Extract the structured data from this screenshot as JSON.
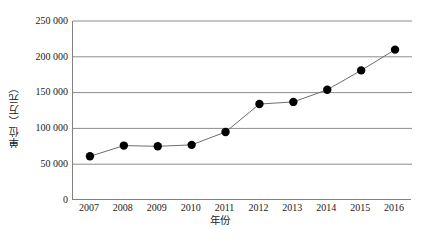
{
  "chart_data": {
    "type": "line",
    "title": "",
    "subtitle": "",
    "xlabel": "年份",
    "ylabel": "单位（万元）",
    "categories": [
      "2007",
      "2008",
      "2009",
      "2010",
      "2011",
      "2012",
      "2013",
      "2014",
      "2015",
      "2016"
    ],
    "values": [
      61000,
      76000,
      75000,
      77000,
      95000,
      134000,
      137000,
      154000,
      181000,
      210000
    ],
    "series": [
      {
        "name": "",
        "values": [
          61000,
          76000,
          75000,
          77000,
          95000,
          134000,
          137000,
          154000,
          181000,
          210000
        ]
      }
    ],
    "ylim": [
      0,
      250000
    ],
    "ytick_values": [
      0,
      50000,
      100000,
      150000,
      200000,
      250000
    ],
    "ytick_labels": [
      "0",
      "50 000",
      "100 000",
      "150 000",
      "200 000",
      "250 000"
    ],
    "xtick_labels": [
      "2007",
      "2008",
      "2009",
      "2010",
      "2011",
      "2012",
      "2013",
      "2014",
      "2015",
      "2016"
    ],
    "grid": "horizontal",
    "legend": "none",
    "marker": "filled-circle",
    "colors": {
      "line": "#6e6e6e",
      "marker": "#000000",
      "gridline": "#8c8c8c",
      "axis": "#808080",
      "text": "#1a1a1a",
      "background": "#ffffff"
    }
  }
}
